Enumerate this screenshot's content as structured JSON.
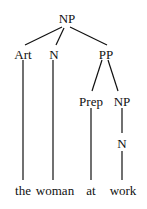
{
  "tree": {
    "root": "NP",
    "level1": [
      "Art",
      "N",
      "PP"
    ],
    "pp_children": [
      "Prep",
      "NP"
    ],
    "np_child": "N",
    "words": [
      "the",
      "woman",
      "at",
      "work"
    ]
  }
}
